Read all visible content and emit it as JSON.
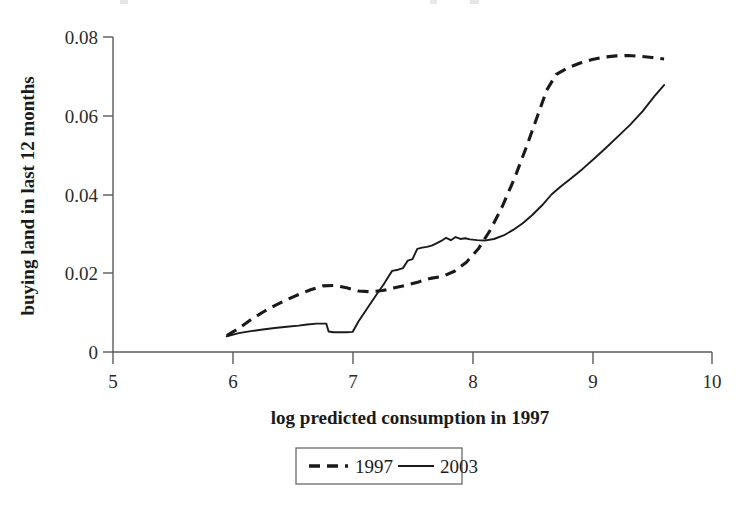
{
  "chart_data": {
    "type": "line",
    "title": "",
    "xlabel": "log predicted consumption in 1997",
    "ylabel": "buying land in last 12 months",
    "xlim": [
      5,
      10
    ],
    "ylim": [
      0,
      0.08
    ],
    "xticks": [
      5,
      6,
      7,
      8,
      9,
      10
    ],
    "xtick_labels": [
      "5",
      "6",
      "7",
      "8",
      "9",
      "10"
    ],
    "yticks": [
      0,
      0.02,
      0.04,
      0.06,
      0.08
    ],
    "ytick_labels": [
      "0",
      "0.02",
      "0.04",
      "0.06",
      "0.08"
    ],
    "grid": false,
    "legend_position": "below-axes",
    "series": [
      {
        "name": "1997",
        "style": "dashed",
        "color": "#1a1a1a",
        "x": [
          5.95,
          6.05,
          6.15,
          6.25,
          6.35,
          6.45,
          6.55,
          6.65,
          6.75,
          6.85,
          6.95,
          7.05,
          7.15,
          7.25,
          7.35,
          7.45,
          7.55,
          7.65,
          7.75,
          7.85,
          7.95,
          8.05,
          8.15,
          8.25,
          8.35,
          8.45,
          8.55,
          8.62,
          8.7,
          8.8,
          8.9,
          9.0,
          9.1,
          9.2,
          9.3,
          9.4,
          9.5,
          9.6
        ],
        "y": [
          0.0042,
          0.006,
          0.0082,
          0.0101,
          0.0118,
          0.0133,
          0.0146,
          0.0158,
          0.0168,
          0.0169,
          0.0163,
          0.0155,
          0.0153,
          0.0156,
          0.0163,
          0.017,
          0.0178,
          0.0187,
          0.0192,
          0.0205,
          0.0228,
          0.0262,
          0.031,
          0.037,
          0.044,
          0.052,
          0.0605,
          0.0665,
          0.0705,
          0.0722,
          0.0734,
          0.0743,
          0.0749,
          0.0752,
          0.0753,
          0.0751,
          0.0748,
          0.0744
        ]
      },
      {
        "name": "2003",
        "style": "solid",
        "color": "#1a1a1a",
        "x": [
          5.95,
          6.05,
          6.15,
          6.25,
          6.35,
          6.45,
          6.55,
          6.62,
          6.7,
          6.74,
          6.78,
          6.8,
          6.84,
          6.95,
          7.0,
          7.05,
          7.12,
          7.2,
          7.26,
          7.3,
          7.33,
          7.38,
          7.42,
          7.46,
          7.5,
          7.54,
          7.58,
          7.62,
          7.66,
          7.7,
          7.74,
          7.78,
          7.82,
          7.86,
          7.9,
          7.94,
          7.98,
          8.04,
          8.1,
          8.18,
          8.26,
          8.34,
          8.42,
          8.5,
          8.58,
          8.66,
          8.74,
          8.82,
          8.92,
          9.02,
          9.12,
          9.22,
          9.32,
          9.42,
          9.52,
          9.6
        ],
        "y": [
          0.004,
          0.0048,
          0.0053,
          0.0057,
          0.0061,
          0.0064,
          0.0067,
          0.007,
          0.0072,
          0.0072,
          0.0072,
          0.0052,
          0.005,
          0.005,
          0.0051,
          0.0078,
          0.011,
          0.0146,
          0.0172,
          0.0192,
          0.0206,
          0.0209,
          0.0213,
          0.0232,
          0.0236,
          0.0262,
          0.0265,
          0.0267,
          0.027,
          0.0276,
          0.0282,
          0.029,
          0.0284,
          0.0292,
          0.0287,
          0.0289,
          0.0286,
          0.0284,
          0.0283,
          0.0287,
          0.0296,
          0.031,
          0.0327,
          0.0348,
          0.0372,
          0.04,
          0.0421,
          0.044,
          0.0465,
          0.0492,
          0.052,
          0.0549,
          0.0578,
          0.0611,
          0.065,
          0.0678
        ]
      }
    ],
    "legend": [
      {
        "label": "1997",
        "style": "dashed"
      },
      {
        "label": "2003",
        "style": "solid"
      }
    ]
  },
  "axes": {
    "y_tick_0": "0",
    "y_tick_1": "0.02",
    "y_tick_2": "0.04",
    "y_tick_3": "0.06",
    "y_tick_4": "0.08",
    "x_tick_0": "5",
    "x_tick_1": "6",
    "x_tick_2": "7",
    "x_tick_3": "8",
    "x_tick_4": "9",
    "x_tick_5": "10",
    "x_title": "log predicted consumption in 1997",
    "y_title": "buying land in last 12 months"
  },
  "legend": {
    "item_1_label": "1997",
    "item_2_label": "2003"
  },
  "colors": {
    "ink": "#1a1a1a",
    "axis": "#5a5a5a",
    "background": "#ffffff"
  }
}
